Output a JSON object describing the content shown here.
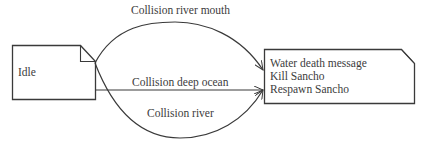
{
  "diagram": {
    "type": "state-transition",
    "states": [
      {
        "id": "idle",
        "label": "Idle"
      },
      {
        "id": "water-death",
        "lines": [
          "Water death message",
          "Kill Sancho",
          "Respawn Sancho"
        ]
      }
    ],
    "transitions": [
      {
        "from": "idle",
        "to": "water-death",
        "label": "Collision river mouth",
        "shape": "upper-arc"
      },
      {
        "from": "idle",
        "to": "water-death",
        "label": "Collision deep ocean",
        "shape": "straight"
      },
      {
        "from": "idle",
        "to": "water-death",
        "label": "Collision river",
        "shape": "lower-arc"
      }
    ],
    "colors": {
      "stroke": "#3a3a3a",
      "text": "#3c3c3c",
      "background": "#ffffff"
    }
  }
}
